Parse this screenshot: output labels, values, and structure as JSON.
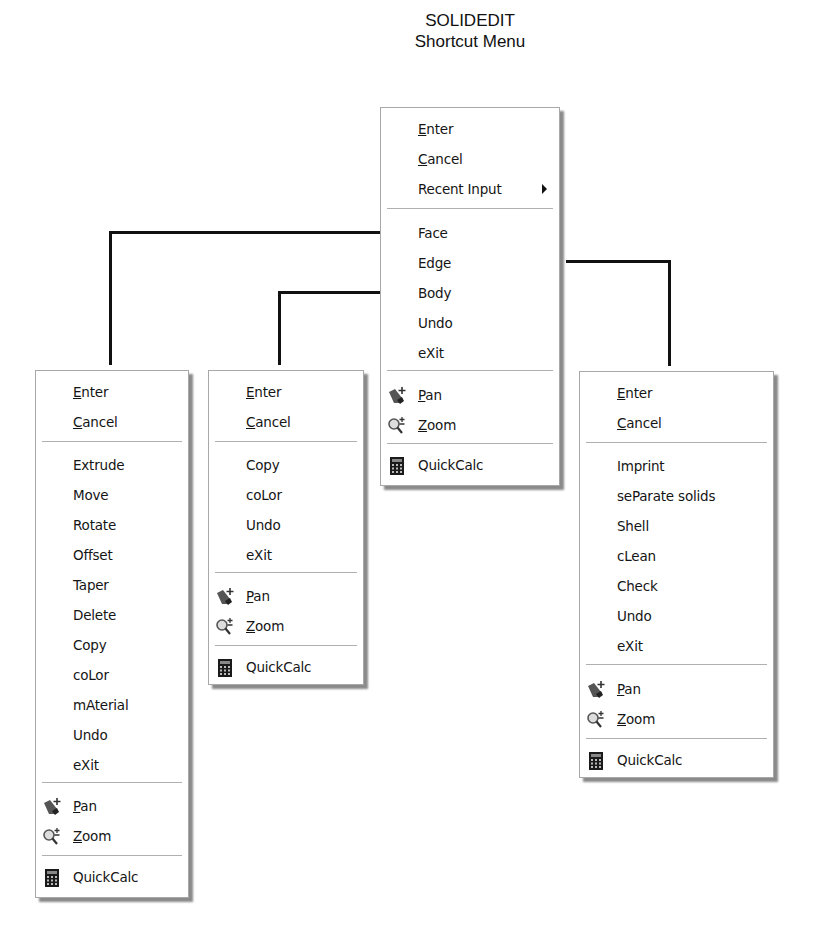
{
  "title": {
    "line1": "SOLIDEDIT",
    "line2": "Shortcut Menu"
  },
  "icons": {
    "pan": "pan-hand-icon",
    "zoom": "zoom-magnifier-icon",
    "quickcalc": "calculator-icon",
    "submenu": "submenu-arrow-icon"
  },
  "colors": {
    "connector": "#111111",
    "menu_border": "#a8a8a8",
    "shadow": "#8a8a8a"
  },
  "main_menu": {
    "items": [
      {
        "pre": "",
        "u": "E",
        "post": "nter"
      },
      {
        "pre": "",
        "u": "C",
        "post": "ancel"
      },
      {
        "label": "Recent Input",
        "has_submenu": true
      },
      {
        "label": "Face"
      },
      {
        "label": "Edge"
      },
      {
        "label": "Body"
      },
      {
        "label": "Undo"
      },
      {
        "label": "eXit"
      },
      {
        "pre": "",
        "u": "P",
        "post": "an",
        "icon": "pan"
      },
      {
        "pre": "",
        "u": "Z",
        "post": "oom",
        "icon": "zoom"
      },
      {
        "label": "QuickCalc",
        "icon": "quickcalc"
      }
    ]
  },
  "face_menu": {
    "items": [
      {
        "pre": "",
        "u": "E",
        "post": "nter"
      },
      {
        "pre": "",
        "u": "C",
        "post": "ancel"
      },
      {
        "label": "Extrude"
      },
      {
        "label": "Move"
      },
      {
        "label": "Rotate"
      },
      {
        "label": "Offset"
      },
      {
        "label": "Taper"
      },
      {
        "label": "Delete"
      },
      {
        "label": "Copy"
      },
      {
        "label": "coLor"
      },
      {
        "label": "mAterial"
      },
      {
        "label": "Undo"
      },
      {
        "label": "eXit"
      },
      {
        "pre": "",
        "u": "P",
        "post": "an",
        "icon": "pan"
      },
      {
        "pre": "",
        "u": "Z",
        "post": "oom",
        "icon": "zoom"
      },
      {
        "label": "QuickCalc",
        "icon": "quickcalc"
      }
    ]
  },
  "edge_menu": {
    "items": [
      {
        "pre": "",
        "u": "E",
        "post": "nter"
      },
      {
        "pre": "",
        "u": "C",
        "post": "ancel"
      },
      {
        "label": "Copy"
      },
      {
        "label": "coLor"
      },
      {
        "label": "Undo"
      },
      {
        "label": "eXit"
      },
      {
        "pre": "",
        "u": "P",
        "post": "an",
        "icon": "pan"
      },
      {
        "pre": "",
        "u": "Z",
        "post": "oom",
        "icon": "zoom"
      },
      {
        "label": "QuickCalc",
        "icon": "quickcalc"
      }
    ]
  },
  "body_menu": {
    "items": [
      {
        "pre": "",
        "u": "E",
        "post": "nter"
      },
      {
        "pre": "",
        "u": "C",
        "post": "ancel"
      },
      {
        "label": "Imprint"
      },
      {
        "label": "seParate solids"
      },
      {
        "label": "Shell"
      },
      {
        "label": "cLean"
      },
      {
        "label": "Check"
      },
      {
        "label": "Undo"
      },
      {
        "label": "eXit"
      },
      {
        "pre": "",
        "u": "P",
        "post": "an",
        "icon": "pan"
      },
      {
        "pre": "",
        "u": "Z",
        "post": "oom",
        "icon": "zoom"
      },
      {
        "label": "QuickCalc",
        "icon": "quickcalc"
      }
    ]
  }
}
